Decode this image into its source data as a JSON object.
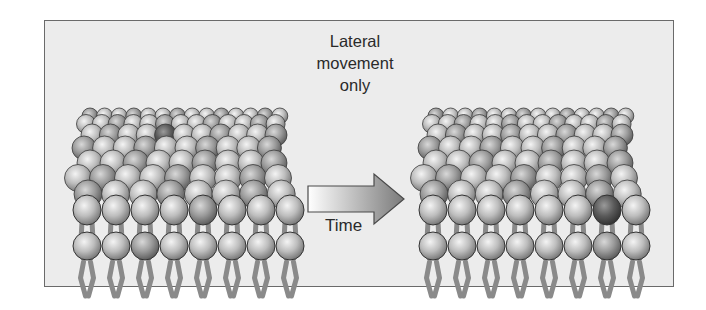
{
  "diagram": {
    "title_lines": [
      "Lateral",
      "movement",
      "only"
    ],
    "arrow_label": "Time",
    "colors": {
      "background": "#ececec",
      "border": "#6a6a6a",
      "head_light": "#f2f2f2",
      "head_mid": "#b9b9b9",
      "head_dark": "#6e6e6e",
      "marked_head": "#555555",
      "tail": "#8a8a8a",
      "text": "#2a2a2a"
    },
    "panels": [
      {
        "name": "before",
        "x": 72,
        "front_row_marked_index": 4,
        "bottom_row_marked_index": 2,
        "top_marked": {
          "row": 2,
          "col": 4
        }
      },
      {
        "name": "after",
        "x": 418,
        "front_row_marked_index": 6,
        "bottom_row_marked_index": 6,
        "top_marked": null
      }
    ]
  }
}
